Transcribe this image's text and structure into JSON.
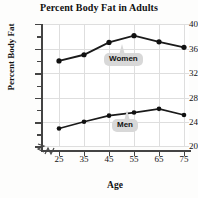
{
  "chart_data": {
    "type": "line",
    "title": "Percent Body Fat in Adults",
    "xlabel": "Age",
    "ylabel": "Percent Body Fat",
    "x": [
      25,
      35,
      45,
      55,
      65,
      75
    ],
    "xticklabels": [
      "25",
      "35",
      "45",
      "55",
      "65",
      "75"
    ],
    "yticklabels": [
      "40",
      "36",
      "32",
      "28",
      "24",
      "20"
    ],
    "ytickvalues": [
      40,
      36,
      32,
      28,
      24,
      20
    ],
    "ylim": [
      20,
      40
    ],
    "xlim": [
      20,
      80
    ],
    "grid": true,
    "legend_position": "inline-callout",
    "axis_break": true,
    "series": [
      {
        "name": "Women",
        "values": [
          34.0,
          35.0,
          37.0,
          38.1,
          37.1,
          36.2
        ],
        "color": "#1a1a1a"
      },
      {
        "name": "Men",
        "values": [
          23.0,
          24.1,
          25.1,
          25.6,
          26.2,
          25.2
        ],
        "color": "#1a1a1a"
      }
    ],
    "annotations": [
      {
        "label": "Women",
        "points_to_x": 55,
        "points_to_y": 38.1
      },
      {
        "label": "Men",
        "points_to_x": 65,
        "points_to_y": 26.2
      }
    ]
  },
  "yticks": [
    {
      "label": "40"
    },
    {
      "label": "36"
    },
    {
      "label": "32"
    },
    {
      "label": "28"
    },
    {
      "label": "24"
    },
    {
      "label": "20"
    }
  ],
  "xticks": [
    {
      "label": "25"
    },
    {
      "label": "35"
    },
    {
      "label": "45"
    },
    {
      "label": "55"
    },
    {
      "label": "65"
    },
    {
      "label": "75"
    }
  ]
}
